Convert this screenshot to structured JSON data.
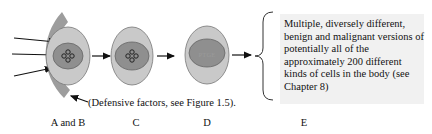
{
  "figure": {
    "stages": [
      {
        "id": "AB",
        "label": "A and B",
        "nucleus": "cross-icon"
      },
      {
        "id": "C",
        "label": "C",
        "nucleus": "cross-icon"
      },
      {
        "id": "D",
        "label": "D",
        "nucleus_text": "PTGE"
      },
      {
        "id": "E",
        "label": "E"
      }
    ],
    "caption": "(Defensive factors, see Figure 1.5).",
    "description": "Multiple, diversely different, benign and malignant versions of potentially all of the approximately 200 different kinds of cells in the body (see Chapter 8)",
    "colors": {
      "shield": "#9d9d9d",
      "cell_outer": "#c9c9c9",
      "cell_nucleus": "#8f8f8f",
      "textbox_bg": "#f1f1f1"
    }
  }
}
